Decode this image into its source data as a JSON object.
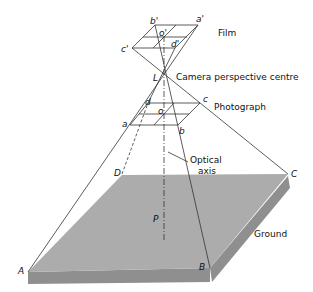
{
  "labels": {
    "film": "Film",
    "camera_centre": "Camera perspective centre",
    "photograph": "Photograph",
    "optical_axis_1": "Optical",
    "optical_axis_2": "axis",
    "ground": "Ground"
  },
  "points": {
    "film": {
      "a": "a'",
      "b": "b'",
      "c": "c'",
      "d": "d'",
      "o": "o'"
    },
    "lens": "L",
    "photo": {
      "a": "a",
      "b": "b",
      "c": "c",
      "d": "d",
      "o": "o"
    },
    "ground": {
      "A": "A",
      "B": "B",
      "C": "C",
      "D": "D",
      "P": "P"
    }
  },
  "colors": {
    "ground_top": "#a9a9a9",
    "ground_side": "#8f8f8f",
    "line": "#333333"
  }
}
